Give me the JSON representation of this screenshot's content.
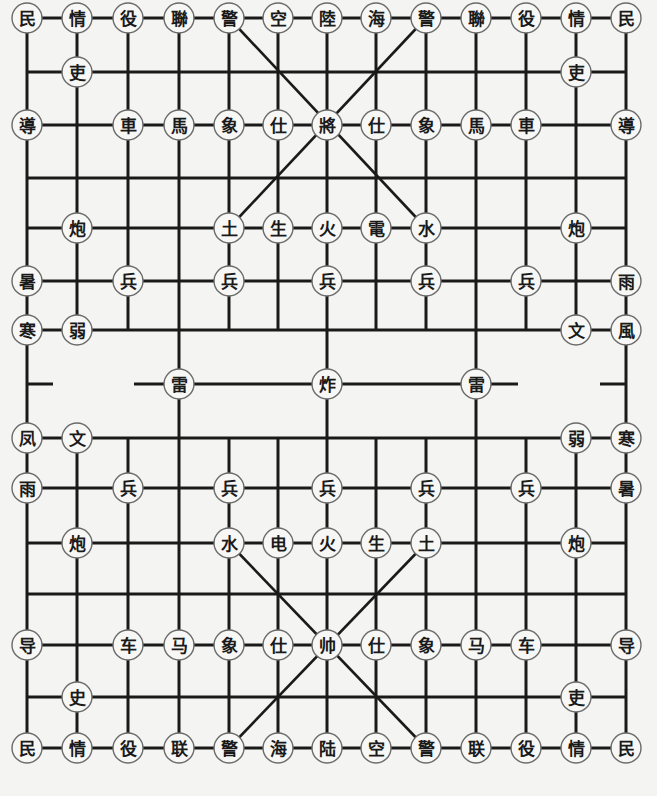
{
  "board": {
    "background": "#f4f4f2",
    "line_color": "#1a1a1a",
    "columns_x": [
      27,
      77,
      128,
      179,
      229,
      278,
      327,
      376,
      426,
      476,
      526,
      576,
      626
    ],
    "rows_y": [
      18,
      72,
      125,
      178,
      228,
      281,
      330,
      384,
      438,
      488,
      543,
      594,
      645,
      697,
      748
    ],
    "piece_radius": 15
  },
  "pieces": [
    {
      "c": 0,
      "r": 0,
      "t": "民"
    },
    {
      "c": 1,
      "r": 0,
      "t": "情"
    },
    {
      "c": 2,
      "r": 0,
      "t": "役"
    },
    {
      "c": 3,
      "r": 0,
      "t": "聯"
    },
    {
      "c": 4,
      "r": 0,
      "t": "警"
    },
    {
      "c": 5,
      "r": 0,
      "t": "空"
    },
    {
      "c": 6,
      "r": 0,
      "t": "陸"
    },
    {
      "c": 7,
      "r": 0,
      "t": "海"
    },
    {
      "c": 8,
      "r": 0,
      "t": "警"
    },
    {
      "c": 9,
      "r": 0,
      "t": "聯"
    },
    {
      "c": 10,
      "r": 0,
      "t": "役"
    },
    {
      "c": 11,
      "r": 0,
      "t": "情"
    },
    {
      "c": 12,
      "r": 0,
      "t": "民"
    },
    {
      "c": 1,
      "r": 1,
      "t": "吏"
    },
    {
      "c": 11,
      "r": 1,
      "t": "吏"
    },
    {
      "c": 0,
      "r": 2,
      "t": "導"
    },
    {
      "c": 2,
      "r": 2,
      "t": "車"
    },
    {
      "c": 3,
      "r": 2,
      "t": "馬"
    },
    {
      "c": 4,
      "r": 2,
      "t": "象"
    },
    {
      "c": 5,
      "r": 2,
      "t": "仕"
    },
    {
      "c": 6,
      "r": 2,
      "t": "將"
    },
    {
      "c": 7,
      "r": 2,
      "t": "仕"
    },
    {
      "c": 8,
      "r": 2,
      "t": "象"
    },
    {
      "c": 9,
      "r": 2,
      "t": "馬"
    },
    {
      "c": 10,
      "r": 2,
      "t": "車"
    },
    {
      "c": 12,
      "r": 2,
      "t": "導"
    },
    {
      "c": 1,
      "r": 4,
      "t": "炮"
    },
    {
      "c": 4,
      "r": 4,
      "t": "土"
    },
    {
      "c": 5,
      "r": 4,
      "t": "生"
    },
    {
      "c": 6,
      "r": 4,
      "t": "火"
    },
    {
      "c": 7,
      "r": 4,
      "t": "電"
    },
    {
      "c": 8,
      "r": 4,
      "t": "水"
    },
    {
      "c": 11,
      "r": 4,
      "t": "炮"
    },
    {
      "c": 0,
      "r": 5,
      "t": "暑"
    },
    {
      "c": 2,
      "r": 5,
      "t": "兵"
    },
    {
      "c": 4,
      "r": 5,
      "t": "兵"
    },
    {
      "c": 6,
      "r": 5,
      "t": "兵"
    },
    {
      "c": 8,
      "r": 5,
      "t": "兵"
    },
    {
      "c": 10,
      "r": 5,
      "t": "兵"
    },
    {
      "c": 12,
      "r": 5,
      "t": "雨"
    },
    {
      "c": 0,
      "r": 6,
      "t": "寒"
    },
    {
      "c": 1,
      "r": 6,
      "t": "弱"
    },
    {
      "c": 11,
      "r": 6,
      "t": "文"
    },
    {
      "c": 12,
      "r": 6,
      "t": "風"
    },
    {
      "c": 3,
      "r": 7,
      "t": "雷"
    },
    {
      "c": 6,
      "r": 7,
      "t": "炸"
    },
    {
      "c": 9,
      "r": 7,
      "t": "雷"
    },
    {
      "c": 0,
      "r": 8,
      "t": "凤"
    },
    {
      "c": 1,
      "r": 8,
      "t": "文"
    },
    {
      "c": 11,
      "r": 8,
      "t": "弱"
    },
    {
      "c": 12,
      "r": 8,
      "t": "寒"
    },
    {
      "c": 0,
      "r": 9,
      "t": "雨"
    },
    {
      "c": 2,
      "r": 9,
      "t": "兵"
    },
    {
      "c": 4,
      "r": 9,
      "t": "兵"
    },
    {
      "c": 6,
      "r": 9,
      "t": "兵"
    },
    {
      "c": 8,
      "r": 9,
      "t": "兵"
    },
    {
      "c": 10,
      "r": 9,
      "t": "兵"
    },
    {
      "c": 12,
      "r": 9,
      "t": "暑"
    },
    {
      "c": 1,
      "r": 10,
      "t": "炮"
    },
    {
      "c": 4,
      "r": 10,
      "t": "水"
    },
    {
      "c": 5,
      "r": 10,
      "t": "电"
    },
    {
      "c": 6,
      "r": 10,
      "t": "火"
    },
    {
      "c": 7,
      "r": 10,
      "t": "生"
    },
    {
      "c": 8,
      "r": 10,
      "t": "土"
    },
    {
      "c": 11,
      "r": 10,
      "t": "炮"
    },
    {
      "c": 0,
      "r": 12,
      "t": "导"
    },
    {
      "c": 2,
      "r": 12,
      "t": "车"
    },
    {
      "c": 3,
      "r": 12,
      "t": "马"
    },
    {
      "c": 4,
      "r": 12,
      "t": "象"
    },
    {
      "c": 5,
      "r": 12,
      "t": "仕"
    },
    {
      "c": 6,
      "r": 12,
      "t": "帅"
    },
    {
      "c": 7,
      "r": 12,
      "t": "仕"
    },
    {
      "c": 8,
      "r": 12,
      "t": "象"
    },
    {
      "c": 9,
      "r": 12,
      "t": "马"
    },
    {
      "c": 10,
      "r": 12,
      "t": "车"
    },
    {
      "c": 12,
      "r": 12,
      "t": "导"
    },
    {
      "c": 1,
      "r": 13,
      "t": "史"
    },
    {
      "c": 11,
      "r": 13,
      "t": "吏"
    },
    {
      "c": 0,
      "r": 14,
      "t": "民"
    },
    {
      "c": 1,
      "r": 14,
      "t": "情"
    },
    {
      "c": 2,
      "r": 14,
      "t": "役"
    },
    {
      "c": 3,
      "r": 14,
      "t": "联"
    },
    {
      "c": 4,
      "r": 14,
      "t": "警"
    },
    {
      "c": 5,
      "r": 14,
      "t": "海"
    },
    {
      "c": 6,
      "r": 14,
      "t": "陆"
    },
    {
      "c": 7,
      "r": 14,
      "t": "空"
    },
    {
      "c": 8,
      "r": 14,
      "t": "警"
    },
    {
      "c": 9,
      "r": 14,
      "t": "联"
    },
    {
      "c": 10,
      "r": 14,
      "t": "役"
    },
    {
      "c": 11,
      "r": 14,
      "t": "情"
    },
    {
      "c": 12,
      "r": 14,
      "t": "民"
    }
  ]
}
